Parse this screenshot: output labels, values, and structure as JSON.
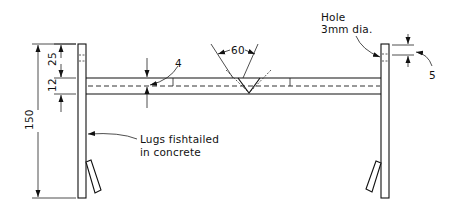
{
  "diagram": {
    "dimensions": {
      "overall_height": "150",
      "post_top_to_beam": "25",
      "beam_depth": "12",
      "groove_depth": "4",
      "notch_angle": "60",
      "hole_offset": "5"
    },
    "annotations": {
      "hole_line1": "Hole",
      "hole_line2": "3mm dia.",
      "lugs_line1": "Lugs fishtailed",
      "lugs_line2": "in concrete"
    },
    "colors": {
      "line": "#111111",
      "background": "#ffffff"
    }
  }
}
